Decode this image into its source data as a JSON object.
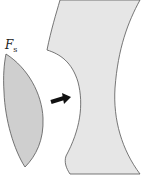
{
  "diagram": {
    "label": {
      "main": "F",
      "sub": "s"
    },
    "colors": {
      "lens_fill": "#cfcfcf",
      "block_fill": "#e6e6e6",
      "stroke": "#555555",
      "arrow": "#111111"
    }
  }
}
